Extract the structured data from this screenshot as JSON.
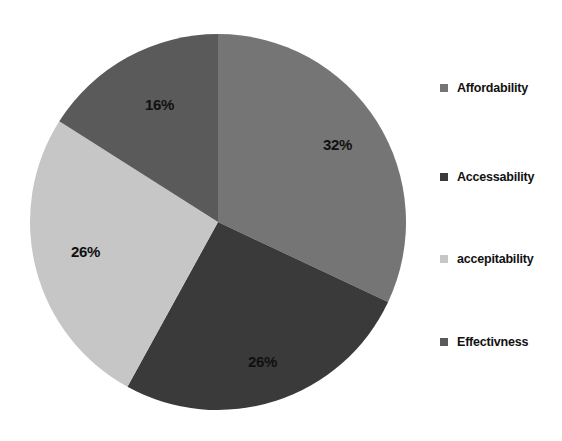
{
  "chart_data": {
    "type": "pie",
    "title": "",
    "subtitle": "",
    "xlabel": "",
    "ylabel": "",
    "legend_position": "right",
    "grid": false,
    "categories": [
      "Affordability",
      "Accessability",
      "accepitability",
      "Effectivness"
    ],
    "values": [
      32,
      26,
      26,
      16
    ],
    "value_labels": [
      "32%",
      "26%",
      "26%",
      "16%"
    ],
    "units": "percent",
    "start_angle_deg": 0,
    "direction": "clockwise",
    "slice_colors": [
      "#757575",
      "#3a3a3a",
      "#c6c6c6",
      "#5a5a5a"
    ],
    "slices": [
      {
        "label": "Affordability",
        "value": 32,
        "display": "32%",
        "color": "#757575"
      },
      {
        "label": "Accessability",
        "value": 26,
        "display": "26%",
        "color": "#3a3a3a"
      },
      {
        "label": "accepitability",
        "value": 26,
        "display": "26%",
        "color": "#c6c6c6"
      },
      {
        "label": "Effectivness",
        "value": 16,
        "display": "16%",
        "color": "#5a5a5a"
      }
    ]
  },
  "pie": {
    "labels": {
      "affordability": "32%",
      "accessability": "26%",
      "accepitability": "26%",
      "effectivness": "16%"
    }
  },
  "legend": {
    "items": [
      {
        "label": "Affordability",
        "color": "#757575"
      },
      {
        "label": "Accessability",
        "color": "#3a3a3a"
      },
      {
        "label": "accepitability",
        "color": "#c6c6c6"
      },
      {
        "label": "Effectivness",
        "color": "#5a5a5a"
      }
    ]
  },
  "colors": {
    "background": "#ffffff",
    "text": "#111111"
  }
}
